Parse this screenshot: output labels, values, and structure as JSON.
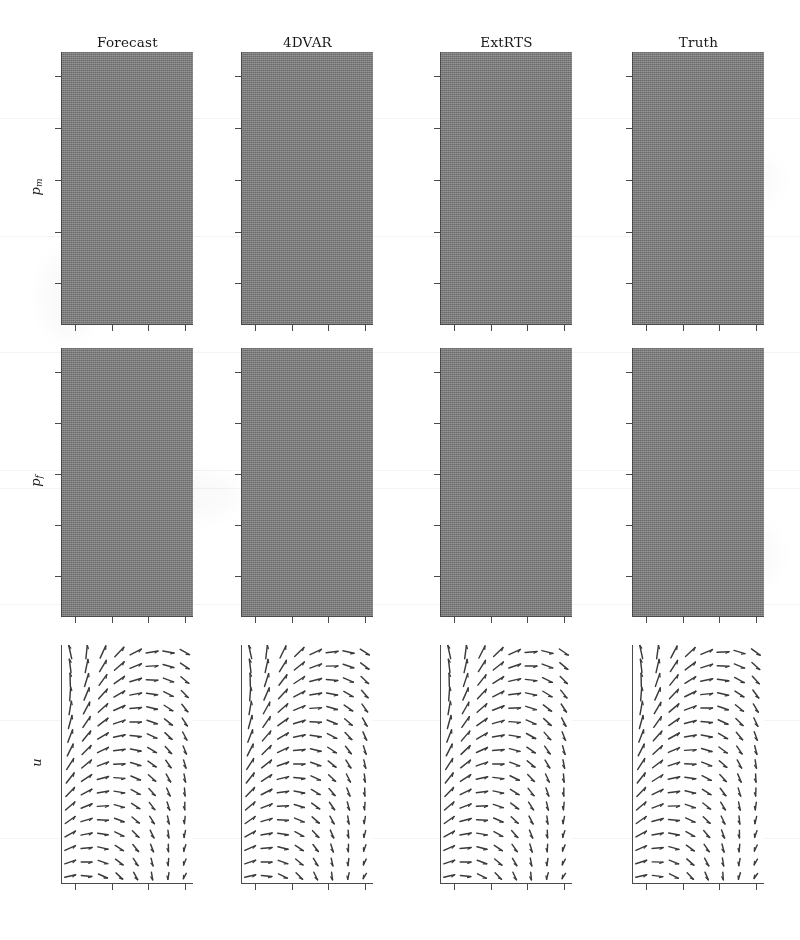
{
  "figure": {
    "type": "image-grid",
    "background_color": "#ffffff",
    "width": 800,
    "height": 940
  },
  "columns": [
    {
      "id": "forecast",
      "label": "Forecast",
      "x": 62,
      "width": 131
    },
    {
      "id": "4dvar",
      "label": "4DVAR",
      "x": 242,
      "width": 131
    },
    {
      "id": "extrts",
      "label": "ExtRTS",
      "x": 441,
      "width": 131
    },
    {
      "id": "truth",
      "label": "Truth",
      "x": 633,
      "width": 131
    }
  ],
  "rows": [
    {
      "id": "p_m",
      "label": "p",
      "sub": "m",
      "y": 52,
      "height": 272,
      "kind": "scalar-field"
    },
    {
      "id": "p_f",
      "label": "p",
      "sub": "f",
      "y": 348,
      "height": 268,
      "kind": "scalar-field"
    },
    {
      "id": "u",
      "label": "u",
      "sub": "",
      "y": 645,
      "height": 238,
      "kind": "vector-field"
    }
  ],
  "header_y": 34,
  "axes": {
    "tick_color": "#4a4a4a",
    "spine_color": "#4a4a4a",
    "x_tick_fractions": [
      0.1,
      0.38,
      0.66,
      0.94
    ],
    "y_tick_fractions_scalar": [
      0.09,
      0.28,
      0.47,
      0.66,
      0.85
    ],
    "y_tick_fractions_quiver": [],
    "tick_length": 6,
    "tick_labels_visible": false
  },
  "colormap": {
    "name": "gray",
    "low": "#2a2a2a",
    "mid": "#808080",
    "high": "#f2f2f2"
  },
  "quiver": {
    "cols": 8,
    "rows": 17,
    "arrow_color": "#3a3a3a",
    "description": "Velocity vector field; vectors rotate from up-left at top to right-down toward lower right"
  },
  "chart_data": {
    "type": "heatmap",
    "title": "",
    "xlabel": "",
    "ylabel": "",
    "grid": false,
    "legend": "none",
    "panels": [
      {
        "row": "p_m",
        "column": "Forecast",
        "kind": "scalar-field",
        "note": "Essentially uniform mid-gray forecast field, no structure",
        "mean_level": 0.5,
        "contrast": 0.02,
        "blobs": []
      },
      {
        "row": "p_m",
        "column": "4DVAR",
        "kind": "scalar-field",
        "note": "Turbulent field with bright blob right-of-centre and dark patches top-right / mid-left",
        "mean_level": 0.48,
        "contrast": 0.42,
        "blobs": [
          {
            "cx": 0.68,
            "cy": 0.44,
            "r": 0.17,
            "level": 1.0
          },
          {
            "cx": 0.55,
            "cy": 0.13,
            "r": 0.22,
            "level": 0.12
          },
          {
            "cx": 0.17,
            "cy": 0.46,
            "r": 0.2,
            "level": 0.16
          },
          {
            "cx": 0.88,
            "cy": 0.7,
            "r": 0.2,
            "level": 0.3
          },
          {
            "cx": 0.3,
            "cy": 0.8,
            "r": 0.22,
            "level": 0.62
          },
          {
            "cx": 0.18,
            "cy": 0.08,
            "r": 0.18,
            "level": 0.66
          },
          {
            "cx": 0.6,
            "cy": 0.95,
            "r": 0.2,
            "level": 0.28
          }
        ]
      },
      {
        "row": "p_m",
        "column": "ExtRTS",
        "kind": "scalar-field",
        "note": "Turbulent field, bright blob right-of-centre, dark band across upper third",
        "mean_level": 0.48,
        "contrast": 0.46,
        "blobs": [
          {
            "cx": 0.66,
            "cy": 0.45,
            "r": 0.16,
            "level": 1.0
          },
          {
            "cx": 0.62,
            "cy": 0.12,
            "r": 0.24,
            "level": 0.1
          },
          {
            "cx": 0.14,
            "cy": 0.5,
            "r": 0.2,
            "level": 0.14
          },
          {
            "cx": 0.9,
            "cy": 0.66,
            "r": 0.18,
            "level": 0.26
          },
          {
            "cx": 0.22,
            "cy": 0.78,
            "r": 0.24,
            "level": 0.6
          },
          {
            "cx": 0.15,
            "cy": 0.06,
            "r": 0.16,
            "level": 0.64
          },
          {
            "cx": 0.7,
            "cy": 0.92,
            "r": 0.22,
            "level": 0.3
          }
        ]
      },
      {
        "row": "p_m",
        "column": "Truth",
        "kind": "scalar-field",
        "note": "Turbulent field, sharp bright blob right-of-centre, bright patch top-left, dark lower-left",
        "mean_level": 0.48,
        "contrast": 0.5,
        "blobs": [
          {
            "cx": 0.66,
            "cy": 0.44,
            "r": 0.15,
            "level": 1.0
          },
          {
            "cx": 0.18,
            "cy": 0.07,
            "r": 0.15,
            "level": 0.92
          },
          {
            "cx": 0.6,
            "cy": 0.15,
            "r": 0.22,
            "level": 0.12
          },
          {
            "cx": 0.12,
            "cy": 0.52,
            "r": 0.2,
            "level": 0.12
          },
          {
            "cx": 0.88,
            "cy": 0.62,
            "r": 0.18,
            "level": 0.24
          },
          {
            "cx": 0.28,
            "cy": 0.8,
            "r": 0.22,
            "level": 0.58
          },
          {
            "cx": 0.72,
            "cy": 0.94,
            "r": 0.22,
            "level": 0.22
          }
        ]
      },
      {
        "row": "p_f",
        "column": "Forecast",
        "kind": "scalar-field",
        "note": "Smooth broad gradient, brightest upper-left, darkening to the right and bottom",
        "mean_level": 0.46,
        "contrast": 0.3,
        "blobs": [
          {
            "cx": 0.3,
            "cy": 0.22,
            "r": 0.55,
            "level": 0.78
          }
        ]
      },
      {
        "row": "p_f",
        "column": "4DVAR",
        "kind": "scalar-field",
        "note": "Bright diffuse blob lower-centre, dark top band",
        "mean_level": 0.44,
        "contrast": 0.4,
        "blobs": [
          {
            "cx": 0.52,
            "cy": 0.7,
            "r": 0.34,
            "level": 0.94
          }
        ]
      },
      {
        "row": "p_f",
        "column": "ExtRTS",
        "kind": "scalar-field",
        "note": "Bright diffuse blob centre-right, dark top band",
        "mean_level": 0.44,
        "contrast": 0.44,
        "blobs": [
          {
            "cx": 0.58,
            "cy": 0.62,
            "r": 0.33,
            "level": 0.97
          }
        ]
      },
      {
        "row": "p_f",
        "column": "Truth",
        "kind": "scalar-field",
        "note": "Strong bright blob centre-right with a tail to the left, dark top band",
        "mean_level": 0.42,
        "contrast": 0.52,
        "blobs": [
          {
            "cx": 0.62,
            "cy": 0.58,
            "r": 0.3,
            "level": 1.0
          },
          {
            "cx": 0.3,
            "cy": 0.52,
            "r": 0.18,
            "level": 0.76
          }
        ]
      },
      {
        "row": "u",
        "column": "Forecast",
        "kind": "vector-field",
        "note": "Vector field: arrows point up-left at top, rotate clockwise toward right/down at lower right",
        "swirl": 0.0
      },
      {
        "row": "u",
        "column": "4DVAR",
        "kind": "vector-field",
        "note": "Vector field similar to forecast, slightly tighter rotation",
        "swirl": 0.06
      },
      {
        "row": "u",
        "column": "ExtRTS",
        "kind": "vector-field",
        "note": "Vector field with more uniform up-left arrows on the left half",
        "swirl": 0.1
      },
      {
        "row": "u",
        "column": "Truth",
        "kind": "vector-field",
        "note": "Vector field, strongest rotation near lower right, arrows shrink to the right edge",
        "swirl": 0.14
      }
    ]
  }
}
